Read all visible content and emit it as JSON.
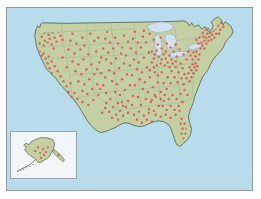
{
  "figure": {
    "kind": "choropleth-dot-density-map",
    "title": "",
    "background_color": "#fdfdfb"
  },
  "map": {
    "name": "united-states-dot-density-map",
    "water_color": "#b9dcec",
    "land_color": "#c5cfa4",
    "land_outline_color": "#4c5a4a",
    "state_border_color": "#9aa68c",
    "lake_color": "#cfe2ee",
    "lake_outline_color": "#8fa6b4",
    "frame_color": "#8f9ba3",
    "dot": {
      "name": "facility-location-dot",
      "color": "#d4594c",
      "radius": 1.25,
      "opacity": 0.88,
      "count_label": ""
    },
    "labels": []
  },
  "inset": {
    "name": "alaska-inset",
    "label": "",
    "background_color": "#f2f6f8",
    "border_color": "#9aa4ac",
    "land_color": "#c5cfa4",
    "land_outline_color": "#4c5a4a",
    "dot_color": "#d4594c"
  },
  "chart_data": {
    "type": "scatter",
    "title": "",
    "xlabel": "",
    "ylabel": "",
    "projection": "albers-usa",
    "legend": [],
    "series": [
      {
        "name": "Locations",
        "marker_color": "#d4594c",
        "marker_radius": 1.25,
        "point_count": 640,
        "regions": [
          {
            "name": "Northeast corridor",
            "density": "very-high"
          },
          {
            "name": "Great Lakes / Midwest",
            "density": "high"
          },
          {
            "name": "Southeast / Atlantic coast",
            "density": "high"
          },
          {
            "name": "Gulf coast / Texas",
            "density": "medium"
          },
          {
            "name": "Pacific coast / California",
            "density": "medium-high"
          },
          {
            "name": "Mountain West / Great Plains",
            "density": "low"
          },
          {
            "name": "Alaska",
            "density": "very-low"
          }
        ]
      }
    ]
  }
}
